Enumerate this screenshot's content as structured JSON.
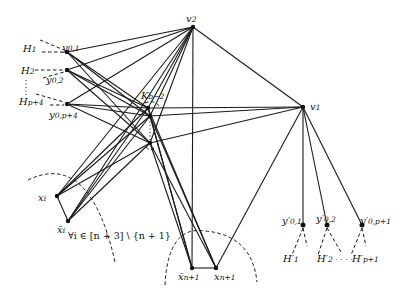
{
  "diagram": {
    "type": "graph",
    "colors": {
      "edge": "#1a1a1a",
      "background": "#ffffff"
    },
    "nodes": [
      {
        "id": "v2",
        "label": "v₂",
        "x": 193,
        "y": 27
      },
      {
        "id": "v1",
        "label": "v₁",
        "x": 303,
        "y": 107
      },
      {
        "id": "y01",
        "label": "y₀,₁",
        "x": 67,
        "y": 52
      },
      {
        "id": "y02",
        "label": "y₀,₂",
        "x": 67,
        "y": 70
      },
      {
        "id": "y0p4",
        "label": "y₀,ₚ₊₄",
        "x": 67,
        "y": 104
      },
      {
        "id": "k1",
        "label": "",
        "x": 148,
        "y": 108
      },
      {
        "id": "k2",
        "label": "",
        "x": 150,
        "y": 116
      },
      {
        "id": "k3",
        "label": "",
        "x": 150,
        "y": 143
      },
      {
        "id": "xi",
        "label": "xᵢ",
        "x": 57,
        "y": 196
      },
      {
        "id": "xbi",
        "label": "x̄ᵢ",
        "x": 68,
        "y": 221
      },
      {
        "id": "xbn1",
        "label": "x̄ₙ₊₁",
        "x": 192,
        "y": 268
      },
      {
        "id": "xn1",
        "label": "xₙ₊₁",
        "x": 216,
        "y": 268
      },
      {
        "id": "yp01",
        "label": "y'₀,₁",
        "x": 303,
        "y": 225
      },
      {
        "id": "yp02",
        "label": "y'₀,₂",
        "x": 327,
        "y": 225
      },
      {
        "id": "yp0p1",
        "label": "y'₀,ₚ₊₁",
        "x": 362,
        "y": 225
      }
    ],
    "labels": {
      "v2": "v",
      "v2_sub": "2",
      "v1": "v",
      "v1_sub": "1",
      "H1": "H",
      "H1_sub": "1",
      "H2": "H",
      "H2_sub": "2",
      "Hp4": "H",
      "Hp4_sub": "p+4",
      "y01": "y",
      "y01_sub": "0,1",
      "y02": "y",
      "y02_sub": "0,2",
      "y0p4": "y",
      "y0p4_sub": "0,p+4",
      "K": "K",
      "K_sub": "b−2",
      "xi": "x",
      "xi_sub": "i",
      "xbi": "x̄",
      "xbi_sub": "i",
      "forall": "∀i ∈ [n + 3] \\ {n + 1}",
      "xbn1": "x̄",
      "xbn1_sub": "n+1",
      "xn1": "x",
      "xn1_sub": "n+1",
      "yp01": "y′",
      "yp01_sub": "0,1",
      "yp02": "y′",
      "yp02_sub": "0,2",
      "yp0p1": "y′",
      "yp0p1_sub": "0,p+1",
      "Hp1": "H′",
      "Hp1_sub": "1",
      "Hp2": "H′",
      "Hp2_sub": "2",
      "Hpp1": "H′",
      "Hpp1_sub": "p+1",
      "dots": "· · · ·"
    }
  }
}
